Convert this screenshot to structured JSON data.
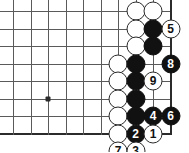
{
  "diagram": {
    "board": {
      "cell": 17.5,
      "origin_x": 13,
      "origin_y": 11,
      "cols": 10,
      "rows": 8,
      "right_edge_col": 9,
      "bottom_edge_row": 7,
      "grid_color": "#5a5a5a",
      "edge_color": "#2b2b2b",
      "background": "#ffffff"
    },
    "star_points": [
      {
        "col": 2,
        "row": 5
      }
    ],
    "stones": [
      {
        "id": "w-a",
        "color": "white",
        "label": "",
        "col": 7,
        "row": 0
      },
      {
        "id": "w-b",
        "color": "white",
        "label": "",
        "col": 8,
        "row": 0
      },
      {
        "id": "w-c",
        "color": "white",
        "label": "",
        "col": 7,
        "row": 1
      },
      {
        "id": "b-a",
        "color": "black",
        "label": "",
        "col": 8,
        "row": 1
      },
      {
        "id": "m5",
        "color": "white",
        "label": "5",
        "col": 9,
        "row": 1
      },
      {
        "id": "w-d",
        "color": "white",
        "label": "",
        "col": 7,
        "row": 2
      },
      {
        "id": "b-b",
        "color": "black",
        "label": "",
        "col": 8,
        "row": 2
      },
      {
        "id": "w-e",
        "color": "white",
        "label": "",
        "col": 6,
        "row": 3
      },
      {
        "id": "b-c",
        "color": "black",
        "label": "",
        "col": 7,
        "row": 3
      },
      {
        "id": "m8",
        "color": "black",
        "label": "8",
        "col": 9,
        "row": 3
      },
      {
        "id": "w-f",
        "color": "white",
        "label": "",
        "col": 6,
        "row": 4
      },
      {
        "id": "b-d",
        "color": "black",
        "label": "",
        "col": 7,
        "row": 4
      },
      {
        "id": "m9",
        "color": "white",
        "label": "9",
        "col": 8,
        "row": 4
      },
      {
        "id": "w-g",
        "color": "white",
        "label": "",
        "col": 6,
        "row": 5
      },
      {
        "id": "b-e",
        "color": "black",
        "label": "",
        "col": 7,
        "row": 5
      },
      {
        "id": "w-h",
        "color": "white",
        "label": "",
        "col": 6,
        "row": 6
      },
      {
        "id": "b-f",
        "color": "black",
        "label": "",
        "col": 7,
        "row": 6
      },
      {
        "id": "m4",
        "color": "black",
        "label": "4",
        "col": 8,
        "row": 6
      },
      {
        "id": "m6",
        "color": "black",
        "label": "6",
        "col": 9,
        "row": 6
      },
      {
        "id": "w-i",
        "color": "white",
        "label": "",
        "col": 6,
        "row": 7
      },
      {
        "id": "m2",
        "color": "black",
        "label": "2",
        "col": 7,
        "row": 7
      },
      {
        "id": "m1",
        "color": "white",
        "label": "1",
        "col": 8,
        "row": 7
      },
      {
        "id": "m7",
        "color": "white",
        "label": "7",
        "col": 6,
        "row": 8
      },
      {
        "id": "m3",
        "color": "white",
        "label": "3",
        "col": 7,
        "row": 8
      }
    ]
  }
}
